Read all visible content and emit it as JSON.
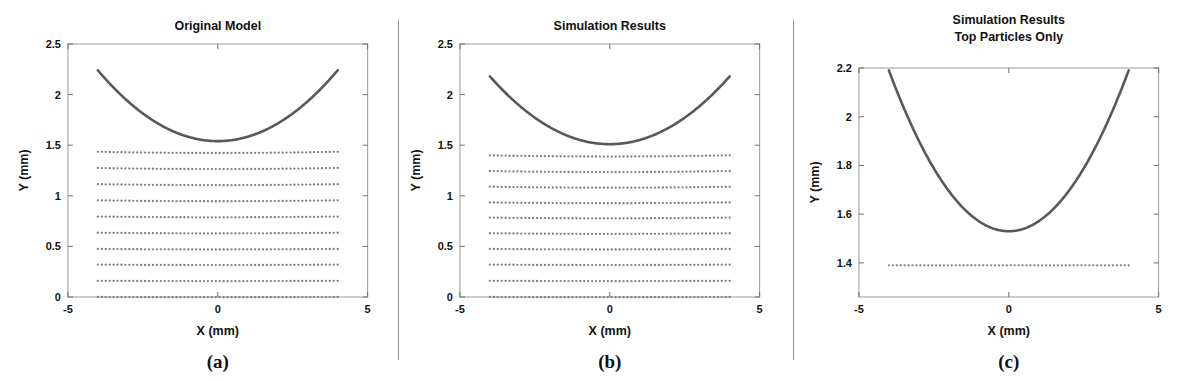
{
  "figure": {
    "caption_a": "(a)",
    "caption_b": "(b)",
    "caption_c": "(c)",
    "colors": {
      "curve": "#595959",
      "particle": "#7d7d7d",
      "axis": "#9a9a9a",
      "text": "#111111",
      "divider": "#8f8f8f",
      "background": "#ffffff"
    }
  },
  "panels": [
    {
      "id": "a",
      "title": "Original Model",
      "caption": "(a)",
      "xlabel": "X (mm)",
      "ylabel": "Y (mm)",
      "xticks": [
        "-5",
        "0",
        "5"
      ],
      "yticks": [
        "0",
        "0.5",
        "1",
        "1.5",
        "2",
        "2.5"
      ]
    },
    {
      "id": "b",
      "title": "Simulation Results",
      "caption": "(b)",
      "xlabel": "X (mm)",
      "ylabel": "Y (mm)",
      "xticks": [
        "-5",
        "0",
        "5"
      ],
      "yticks": [
        "0",
        "0.5",
        "1",
        "1.5",
        "2",
        "2.5"
      ]
    },
    {
      "id": "c",
      "title_line1": "Simulation Results",
      "title_line2": "Top Particles Only",
      "caption": "(c)",
      "xlabel": "X (mm)",
      "ylabel": "Y (mm)",
      "xticks": [
        "-5",
        "0",
        "5"
      ],
      "yticks": [
        "1.4",
        "1.6",
        "1.8",
        "2",
        "2.2"
      ]
    }
  ],
  "chart_data": [
    {
      "id": "panel-a",
      "type": "scatter",
      "title": "Original Model",
      "xlabel": "X (mm)",
      "ylabel": "Y (mm)",
      "xlim": [
        -5,
        5
      ],
      "ylim": [
        0,
        2.5
      ],
      "xticks": [
        -5,
        0,
        5
      ],
      "yticks": [
        0,
        0.5,
        1,
        1.5,
        2,
        2.5
      ],
      "grid": false,
      "legend": "none",
      "series": [
        {
          "name": "mold surface curve",
          "type": "line",
          "x_range": [
            -4,
            4
          ],
          "y_at_edges": 2.24,
          "y_at_center": 1.54,
          "shape": "parabola",
          "coefficients": {
            "a": 0.04375,
            "b": 0.0,
            "c": 1.54
          }
        },
        {
          "name": "particle bed rows",
          "type": "scatter",
          "row_count": 10,
          "row_y_values": [
            1.435,
            1.275,
            1.115,
            0.955,
            0.795,
            0.635,
            0.475,
            0.32,
            0.16,
            0.0
          ],
          "particles_per_row": 62,
          "x_range": [
            -4,
            4
          ],
          "marker": "dot"
        }
      ]
    },
    {
      "id": "panel-b",
      "type": "scatter",
      "title": "Simulation Results",
      "xlabel": "X (mm)",
      "ylabel": "Y (mm)",
      "xlim": [
        -5,
        5
      ],
      "ylim": [
        0,
        2.5
      ],
      "xticks": [
        -5,
        0,
        5
      ],
      "yticks": [
        0,
        0.5,
        1,
        1.5,
        2,
        2.5
      ],
      "grid": false,
      "legend": "none",
      "series": [
        {
          "name": "mold surface curve",
          "type": "line",
          "x_range": [
            -4,
            4
          ],
          "y_at_edges": 2.18,
          "y_at_center": 1.51,
          "shape": "parabola",
          "coefficients": {
            "a": 0.041875,
            "b": 0.0,
            "c": 1.51
          }
        },
        {
          "name": "particle bed rows",
          "type": "scatter",
          "row_count": 10,
          "row_y_values": [
            1.4,
            1.245,
            1.09,
            0.935,
            0.785,
            0.63,
            0.475,
            0.32,
            0.16,
            0.0
          ],
          "particles_per_row": 62,
          "x_range": [
            -4,
            4
          ],
          "marker": "dot"
        }
      ]
    },
    {
      "id": "panel-c",
      "type": "scatter",
      "title": "Simulation Results Top Particles Only",
      "xlabel": "X (mm)",
      "ylabel": "Y (mm)",
      "xlim": [
        -5,
        5
      ],
      "ylim": [
        1.26,
        2.2
      ],
      "xticks": [
        -5,
        0,
        5
      ],
      "yticks": [
        1.4,
        1.6,
        1.8,
        2,
        2.2
      ],
      "grid": false,
      "legend": "none",
      "series": [
        {
          "name": "mold surface curve",
          "type": "line",
          "x_range": [
            -4,
            4
          ],
          "y_at_edges": 2.19,
          "y_at_center": 1.53,
          "shape": "parabola",
          "coefficients": {
            "a": 0.04125,
            "b": 0.0,
            "c": 1.53
          }
        },
        {
          "name": "top particle row",
          "type": "scatter",
          "row_count": 1,
          "row_y_values": [
            1.39
          ],
          "particles_per_row": 62,
          "x_range": [
            -4,
            4
          ],
          "marker": "dot"
        }
      ]
    }
  ]
}
